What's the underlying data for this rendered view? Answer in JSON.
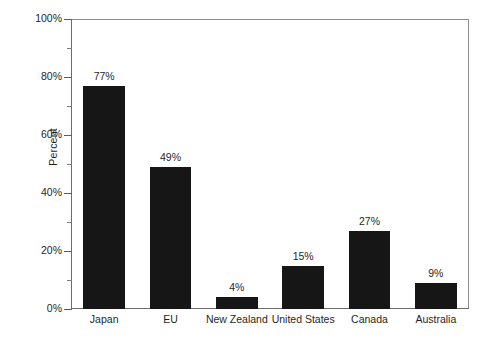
{
  "chart_data": {
    "type": "bar",
    "title": "",
    "subtitle": "",
    "xlabel": "",
    "ylabel": "Percent",
    "categories": [
      "Japan",
      "EU",
      "New Zealand",
      "United States",
      "Canada",
      "Australia"
    ],
    "values": [
      77,
      49,
      4,
      15,
      27,
      9
    ],
    "value_labels": [
      "77%",
      "49%",
      "4%",
      "15%",
      "27%",
      "9%"
    ],
    "ylim": [
      0,
      100
    ],
    "ytick_values": [
      0,
      20,
      40,
      60,
      80,
      100
    ],
    "ytick_labels": [
      "0%",
      "20%",
      "40%",
      "60%",
      "80%",
      "100%"
    ],
    "yminor_tick_values": [
      10,
      30,
      50,
      70,
      90
    ],
    "grid": false,
    "legend": null,
    "legend_position": "none",
    "bar_color": "#161616",
    "axis_color": "#6d6d6d",
    "frame_color": "#8e8e8e",
    "background_color": "#ffffff"
  }
}
